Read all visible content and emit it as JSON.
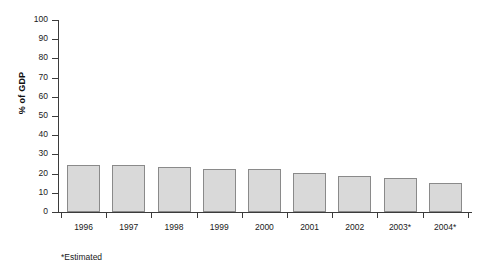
{
  "chart_data": {
    "type": "bar",
    "title": "",
    "xlabel": "",
    "ylabel": "% of GDP",
    "categories": [
      "1996",
      "1997",
      "1998",
      "1999",
      "2000",
      "2001",
      "2002",
      "2003*",
      "2004*"
    ],
    "values": [
      24.5,
      24.3,
      23.7,
      22.3,
      22.5,
      20.5,
      19.0,
      17.5,
      15.3
    ],
    "ylim": [
      0,
      100
    ],
    "ytick_step": 10,
    "ytick_labels": [
      "0",
      "10",
      "20",
      "30",
      "40",
      "50",
      "60",
      "70",
      "80",
      "90",
      "100"
    ],
    "grid": false,
    "legend": null,
    "annotations": [
      "*Estimated"
    ],
    "bar_fill_color": "#d9d9d9",
    "bar_border_color": "#8a8a8a",
    "axis_color": "#3b3b3b"
  },
  "footnote": {
    "text": "*Estimated"
  }
}
